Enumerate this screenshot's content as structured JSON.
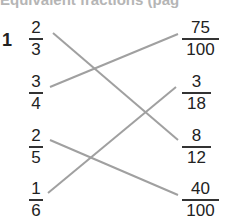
{
  "header": {
    "title": "Equivalent fractions (pag"
  },
  "question": {
    "number": "1"
  },
  "left": [
    {
      "num": "2",
      "den": "3"
    },
    {
      "num": "3",
      "den": "4"
    },
    {
      "num": "2",
      "den": "5"
    },
    {
      "num": "1",
      "den": "6"
    }
  ],
  "right": [
    {
      "num": "75",
      "den": "100"
    },
    {
      "num": "3",
      "den": "18"
    },
    {
      "num": "8",
      "den": "12"
    },
    {
      "num": "40",
      "den": "100"
    }
  ],
  "matches": [
    {
      "left": "2/3",
      "right": "8/12"
    },
    {
      "left": "3/4",
      "right": "75/100"
    },
    {
      "left": "2/5",
      "right": "40/100"
    },
    {
      "left": "1/6",
      "right": "3/18"
    }
  ],
  "colors": {
    "line": "#a0a0a0",
    "text": "#222222",
    "header": "#b5b5b5"
  }
}
